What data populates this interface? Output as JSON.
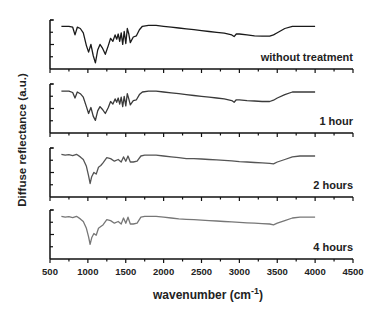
{
  "chart_data": {
    "type": "line",
    "layout": "stacked-panels",
    "title": "",
    "xlabel": "wavenumber (cm",
    "xlabel_sup": "-1",
    "xlabel_close": ")",
    "ylabel": "Diffuse reflectance (a.u.)",
    "xlim": [
      500,
      4500
    ],
    "xticks": [
      500,
      1000,
      1500,
      2000,
      2500,
      3000,
      3500,
      4000,
      4500
    ],
    "grid": false,
    "legend": "per-panel labels, bottom-right",
    "panels": [
      {
        "label": "without treatment",
        "color": "#1a1a1a",
        "x": [
          650,
          700,
          750,
          800,
          830,
          860,
          900,
          940,
          980,
          1010,
          1040,
          1070,
          1100,
          1130,
          1160,
          1190,
          1230,
          1270,
          1300,
          1330,
          1360,
          1380,
          1400,
          1420,
          1440,
          1460,
          1480,
          1500,
          1520,
          1540,
          1560,
          1600,
          1640,
          1680,
          1720,
          1800,
          1900,
          2000,
          2100,
          2200,
          2300,
          2400,
          2500,
          2600,
          2700,
          2800,
          2900,
          2930,
          2960,
          3000,
          3100,
          3200,
          3300,
          3400,
          3450,
          3500,
          3600,
          3700,
          3800,
          4000
        ],
        "y": [
          0.9,
          0.9,
          0.9,
          0.88,
          0.7,
          0.88,
          0.85,
          0.75,
          0.45,
          0.3,
          0.48,
          0.22,
          0.05,
          0.35,
          0.48,
          0.4,
          0.25,
          0.45,
          0.62,
          0.55,
          0.7,
          0.6,
          0.72,
          0.55,
          0.75,
          0.48,
          0.78,
          0.5,
          0.85,
          0.72,
          0.52,
          0.65,
          0.68,
          0.82,
          0.9,
          0.92,
          0.92,
          0.9,
          0.88,
          0.86,
          0.84,
          0.82,
          0.8,
          0.78,
          0.76,
          0.74,
          0.7,
          0.66,
          0.72,
          0.72,
          0.7,
          0.68,
          0.67,
          0.67,
          0.7,
          0.75,
          0.85,
          0.9,
          0.9,
          0.9
        ]
      },
      {
        "label": "1 hour",
        "color": "#3a3a3a",
        "x": [
          650,
          700,
          750,
          800,
          830,
          860,
          900,
          940,
          980,
          1010,
          1040,
          1070,
          1100,
          1130,
          1160,
          1190,
          1230,
          1270,
          1300,
          1330,
          1360,
          1380,
          1400,
          1420,
          1440,
          1460,
          1480,
          1500,
          1520,
          1540,
          1560,
          1600,
          1640,
          1680,
          1720,
          1800,
          1900,
          2000,
          2100,
          2200,
          2300,
          2400,
          2500,
          2600,
          2700,
          2800,
          2900,
          2930,
          2960,
          3000,
          3100,
          3200,
          3300,
          3400,
          3450,
          3500,
          3600,
          3700,
          3800,
          4000
        ],
        "y": [
          0.88,
          0.88,
          0.88,
          0.85,
          0.72,
          0.86,
          0.82,
          0.74,
          0.52,
          0.36,
          0.5,
          0.3,
          0.2,
          0.42,
          0.52,
          0.46,
          0.36,
          0.5,
          0.64,
          0.58,
          0.7,
          0.62,
          0.72,
          0.58,
          0.74,
          0.52,
          0.76,
          0.54,
          0.82,
          0.7,
          0.56,
          0.66,
          0.68,
          0.8,
          0.86,
          0.88,
          0.88,
          0.86,
          0.84,
          0.82,
          0.8,
          0.78,
          0.76,
          0.74,
          0.72,
          0.7,
          0.66,
          0.62,
          0.68,
          0.68,
          0.66,
          0.65,
          0.64,
          0.64,
          0.67,
          0.72,
          0.8,
          0.86,
          0.86,
          0.86
        ]
      },
      {
        "label": "2 hours",
        "color": "#555555",
        "x": [
          650,
          700,
          750,
          800,
          850,
          900,
          940,
          980,
          1010,
          1030,
          1050,
          1080,
          1110,
          1140,
          1170,
          1200,
          1250,
          1300,
          1350,
          1400,
          1440,
          1470,
          1500,
          1530,
          1560,
          1600,
          1650,
          1700,
          1750,
          1800,
          1900,
          2000,
          2100,
          2200,
          2300,
          2400,
          2500,
          2600,
          2700,
          2800,
          2900,
          3000,
          3100,
          3200,
          3300,
          3400,
          3450,
          3500,
          3600,
          3700,
          3800,
          4000
        ],
        "y": [
          0.9,
          0.88,
          0.89,
          0.87,
          0.9,
          0.84,
          0.78,
          0.62,
          0.4,
          0.22,
          0.38,
          0.48,
          0.44,
          0.6,
          0.64,
          0.7,
          0.82,
          0.8,
          0.74,
          0.78,
          0.72,
          0.84,
          0.74,
          0.86,
          0.72,
          0.72,
          0.74,
          0.86,
          0.88,
          0.88,
          0.88,
          0.86,
          0.84,
          0.82,
          0.8,
          0.8,
          0.79,
          0.78,
          0.77,
          0.76,
          0.75,
          0.73,
          0.72,
          0.71,
          0.7,
          0.69,
          0.68,
          0.72,
          0.78,
          0.84,
          0.86,
          0.86
        ]
      },
      {
        "label": "4 hours",
        "color": "#777777",
        "x": [
          650,
          700,
          750,
          800,
          850,
          900,
          940,
          980,
          1010,
          1030,
          1050,
          1080,
          1110,
          1140,
          1170,
          1200,
          1250,
          1300,
          1350,
          1400,
          1440,
          1470,
          1500,
          1530,
          1560,
          1600,
          1650,
          1700,
          1750,
          1800,
          1900,
          2000,
          2100,
          2200,
          2300,
          2400,
          2500,
          2600,
          2700,
          2800,
          2900,
          3000,
          3100,
          3200,
          3300,
          3400,
          3450,
          3500,
          3600,
          3700,
          3800,
          4000
        ],
        "y": [
          0.9,
          0.88,
          0.89,
          0.87,
          0.9,
          0.84,
          0.78,
          0.62,
          0.42,
          0.25,
          0.4,
          0.5,
          0.46,
          0.62,
          0.66,
          0.7,
          0.82,
          0.8,
          0.74,
          0.78,
          0.72,
          0.86,
          0.74,
          0.88,
          0.72,
          0.72,
          0.74,
          0.88,
          0.9,
          0.9,
          0.9,
          0.88,
          0.86,
          0.84,
          0.83,
          0.82,
          0.81,
          0.8,
          0.79,
          0.78,
          0.77,
          0.76,
          0.75,
          0.74,
          0.73,
          0.72,
          0.7,
          0.74,
          0.8,
          0.86,
          0.88,
          0.88
        ]
      }
    ]
  }
}
